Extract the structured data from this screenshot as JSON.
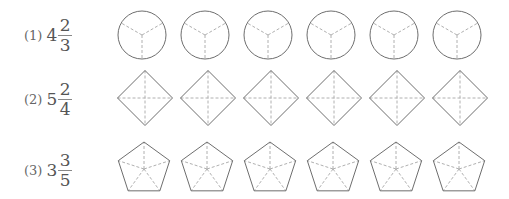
{
  "problems": [
    {
      "index": "(1)",
      "whole": "4",
      "numerator": "2",
      "denominator": "3",
      "shape": "circle",
      "parts": 3,
      "count": 6
    },
    {
      "index": "(2)",
      "whole": "5",
      "numerator": "2",
      "denominator": "4",
      "shape": "diamond",
      "parts": 4,
      "count": 6
    },
    {
      "index": "(3)",
      "whole": "3",
      "numerator": "3",
      "denominator": "5",
      "shape": "pentagon",
      "parts": 5,
      "count": 6
    }
  ],
  "colors": {
    "outline": "#6e6e6e",
    "dashed": "#b0b0b0"
  }
}
